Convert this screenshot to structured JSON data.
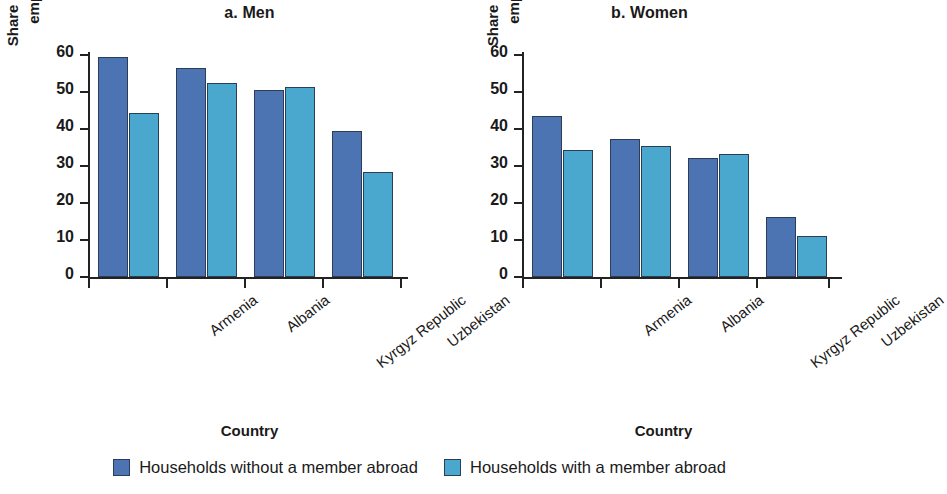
{
  "chart_data": {
    "type": "bar",
    "panels": [
      {
        "id": "men",
        "title": "a. Men",
        "xlabel": "Country",
        "ylabel": "Share of individuals\nemployed (%)",
        "categories": [
          "Armenia",
          "Albania",
          "Kyrgyz Republic",
          "Uzbekistan"
        ],
        "ylim": [
          0,
          60
        ],
        "yticks": [
          0,
          10,
          20,
          30,
          40,
          50,
          60
        ],
        "series": [
          {
            "name": "Households without a member abroad",
            "values": [
              59,
              56,
              50,
              39
            ]
          },
          {
            "name": "Households with a member abroad",
            "values": [
              44,
              52,
              51,
              28
            ]
          }
        ]
      },
      {
        "id": "women",
        "title": "b. Women",
        "xlabel": "Country",
        "ylabel": "Share of individuals\nemployed (%)",
        "categories": [
          "Armenia",
          "Albania",
          "Kyrgyz Republic",
          "Uzbekistan"
        ],
        "ylim": [
          0,
          60
        ],
        "yticks": [
          0,
          10,
          20,
          30,
          40,
          50,
          60
        ],
        "series": [
          {
            "name": "Households without a member abroad",
            "values": [
              43,
              37,
              32,
              16
            ]
          },
          {
            "name": "Households with a member abroad",
            "values": [
              34,
              35,
              33,
              11
            ]
          }
        ]
      }
    ],
    "legend": {
      "position": "bottom",
      "entries": [
        {
          "label": "Households without a member abroad",
          "color": "#4c74b2"
        },
        {
          "label": "Households with a member abroad",
          "color": "#4aa7ce"
        }
      ]
    },
    "grid": false,
    "colors": {
      "series_without_abroad": "#4c74b2",
      "series_with_abroad": "#4aa7ce",
      "axis": "#222222",
      "bar_outline": "#2c3d55",
      "background": "#ffffff"
    }
  }
}
